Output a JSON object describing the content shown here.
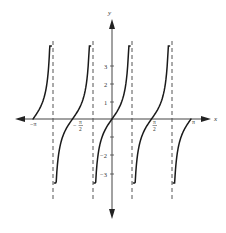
{
  "chart_data": {
    "type": "line",
    "function": "y = tan(2x)",
    "title": "",
    "xlabel": "x",
    "ylabel": "y",
    "xlim": [
      -3.3,
      3.3
    ],
    "ylim": [
      -4.5,
      5.5
    ],
    "grid": false,
    "legend": null,
    "x_ticks": [
      {
        "value": -3.14159,
        "label": "−π"
      },
      {
        "value": -1.5708,
        "label": "−π/2"
      },
      {
        "value": 1.5708,
        "label": "π/2"
      },
      {
        "value": 3.14159,
        "label": "π"
      }
    ],
    "y_ticks": [
      {
        "value": 3,
        "label": "3"
      },
      {
        "value": 2,
        "label": "2"
      },
      {
        "value": 1,
        "label": "1"
      },
      {
        "value": -1,
        "label": ""
      },
      {
        "value": -2,
        "label": "−2"
      },
      {
        "value": -3,
        "label": "−3"
      }
    ],
    "asymptotes": [
      -2.3562,
      -0.7854,
      0.7854,
      2.3562
    ],
    "zeros": [
      -3.14159,
      -1.5708,
      0,
      1.5708,
      3.14159
    ],
    "series": [
      {
        "name": "branch-1",
        "x_range": [
          -3.14159,
          -2.41
        ],
        "y_range": [
          0,
          4.0
        ]
      },
      {
        "name": "branch-2",
        "x_range": [
          -2.29,
          -0.85
        ],
        "y_range": [
          -3.6,
          4.0
        ]
      },
      {
        "name": "branch-3",
        "x_range": [
          -0.72,
          0.72
        ],
        "y_range": [
          -3.6,
          4.0
        ]
      },
      {
        "name": "branch-4",
        "x_range": [
          0.85,
          2.29
        ],
        "y_range": [
          -3.6,
          4.0
        ]
      },
      {
        "name": "branch-5",
        "x_range": [
          2.43,
          3.14159
        ],
        "y_range": [
          -3.6,
          0
        ]
      }
    ],
    "colors": {
      "curve": "#1a1a1a",
      "axis": "#444444",
      "asymptote": "#555555"
    }
  },
  "labels": {
    "x_axis": "x",
    "y_axis": "y",
    "neg_pi": "−π",
    "pi": "π",
    "half_pi_num": "π",
    "half_pi_den": "2",
    "minus": "−",
    "y3": "3",
    "y2": "2",
    "y1": "1",
    "yn2": "−2",
    "yn3": "−3"
  }
}
